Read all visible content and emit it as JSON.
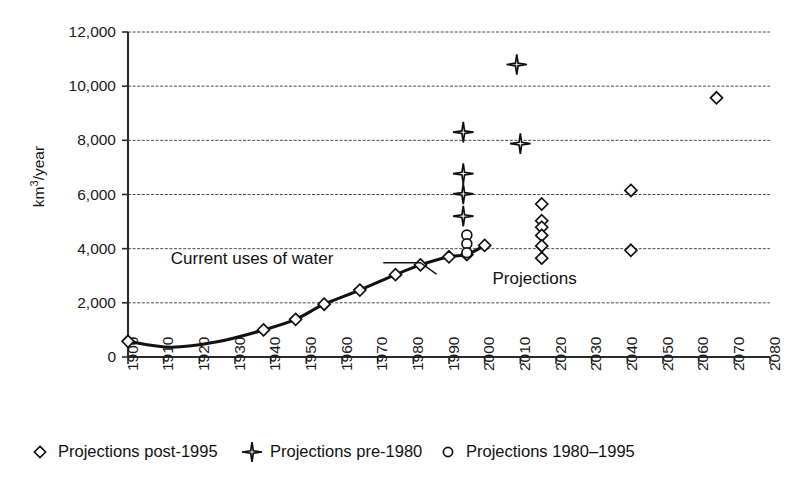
{
  "chart_data": {
    "type": "scatter",
    "title": "",
    "xlabel": "",
    "ylabel": "km³/year",
    "ylabel_base": "km",
    "ylabel_sup": "3",
    "ylabel_rest": "/year",
    "xlim": [
      1900,
      2080
    ],
    "ylim": [
      0,
      12000
    ],
    "ytick_interval": 2000,
    "xtick_interval": 10,
    "grid": true,
    "legend_position": "bottom",
    "yticks": [
      "0",
      "2,000",
      "4,000",
      "6,000",
      "8,000",
      "10,000",
      "12,000"
    ],
    "ytick_values": [
      0,
      2000,
      4000,
      6000,
      8000,
      10000,
      12000
    ],
    "xticks": [
      "1900",
      "1910",
      "1920",
      "1930",
      "1940",
      "1950",
      "1960",
      "1970",
      "1980",
      "1990",
      "2000",
      "2010",
      "2020",
      "2030",
      "2040",
      "2050",
      "2060",
      "2070",
      "2080"
    ],
    "xtick_values": [
      1900,
      1910,
      1920,
      1930,
      1940,
      1950,
      1960,
      1970,
      1980,
      1990,
      2000,
      2010,
      2020,
      2030,
      2040,
      2050,
      2060,
      2070,
      2080
    ],
    "annotations": [
      {
        "text": "Current uses of water",
        "x": 1912,
        "y": 3450,
        "anchor": "start"
      },
      {
        "text": "Projections",
        "x": 2014,
        "y": 2700,
        "anchor": "middle"
      }
    ],
    "series": [
      {
        "name": "Current uses of water",
        "marker": "diamond",
        "line": true,
        "x": [
          1900,
          1912,
          1925,
          1938,
          1947,
          1955,
          1965,
          1975,
          1982,
          1990,
          1995,
          2000
        ],
        "y": [
          580,
          360,
          560,
          1000,
          1390,
          1950,
          2470,
          3040,
          3400,
          3700,
          3780,
          4120
        ]
      },
      {
        "name": "Projections post-1995",
        "marker": "diamond",
        "line": false,
        "x": [
          2016,
          2016,
          2016,
          2016,
          2016,
          2016,
          2041,
          2041,
          2065
        ],
        "y": [
          5650,
          5030,
          4790,
          4490,
          4100,
          3650,
          6150,
          3940,
          9570
        ]
      },
      {
        "name": "Projections pre-1980",
        "marker": "star4",
        "line": false,
        "x": [
          1994,
          1994,
          1994,
          1994,
          2009,
          2010
        ],
        "y": [
          8300,
          6770,
          6020,
          5200,
          10800,
          7880
        ]
      },
      {
        "name": "Projections 1980–1995",
        "marker": "circle",
        "line": false,
        "x": [
          1995,
          1995,
          1995
        ],
        "y": [
          4500,
          4180,
          3850
        ]
      }
    ]
  },
  "legend": {
    "items": [
      {
        "label": "Projections post-1995",
        "marker": "diamond"
      },
      {
        "label": "Projections pre-1980",
        "marker": "star4"
      },
      {
        "label": "Projections 1980–1995",
        "marker": "circle"
      }
    ]
  },
  "colors": {
    "line": "#111111",
    "marker_fill": "#ffffff",
    "grid": "#4a4a4a",
    "axis": "#2b2b2b",
    "text": "#1a1a1a",
    "background": "#ffffff"
  }
}
